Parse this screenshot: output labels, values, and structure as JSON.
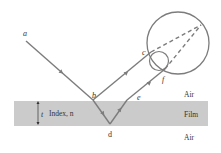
{
  "diagram": {
    "type": "thin-film interference",
    "colors": {
      "ray": "#7c7c7c",
      "film_fill": "#cbcbcb",
      "text": "#333333",
      "circle": "#7c7c7c"
    },
    "points": {
      "a": "a",
      "b": "b",
      "c": "c",
      "d": "d",
      "e": "e",
      "f": "f"
    },
    "media": {
      "top": "Air",
      "middle": "Film",
      "bottom": "Air"
    },
    "film_thickness_label": "t",
    "film_index_label": "Index, n"
  }
}
